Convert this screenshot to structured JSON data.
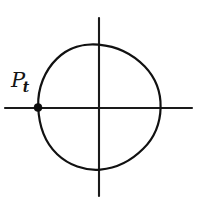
{
  "figure": {
    "background_color": "#ffffff",
    "ink_color": "#111111",
    "width": 201,
    "height": 202
  },
  "axes": {
    "horizontal": {
      "name": "horizontal-axis",
      "x1": 5,
      "y1": 108,
      "x2": 192,
      "y2": 108
    },
    "vertical": {
      "name": "vertical-axis",
      "x1": 99,
      "y1": 18,
      "x2": 99,
      "y2": 196
    },
    "origin": {
      "x": 99,
      "y": 108
    }
  },
  "circle": {
    "name": "main-circle",
    "center_x": 99,
    "center_y": 107.5,
    "radius": 62,
    "top_y": 45,
    "bottom_y": 170,
    "left_x": 37,
    "right_x": 161
  },
  "point": {
    "label_base": "P",
    "label_subscript": "t",
    "marker_x": 38,
    "marker_y": 107.5,
    "marker_radius": 4,
    "label_x": 11,
    "label_y": 70
  }
}
